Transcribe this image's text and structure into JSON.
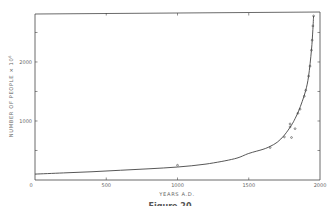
{
  "chart_data": {
    "type": "line",
    "title": "",
    "xlabel": "YEARS A.D.",
    "ylabel": "NUMBER OF PEOPLE × 10⁶",
    "xlim": [
      0,
      2000
    ],
    "ylim": [
      0,
      2830
    ],
    "x_ticks": [
      0,
      500,
      1000,
      1500,
      2000
    ],
    "x_tick_labels": [
      "0",
      "500",
      "1000",
      "1500",
      "2000"
    ],
    "y_ticks": [
      1000,
      2000
    ],
    "y_tick_labels": [
      "1000",
      "2000"
    ],
    "y_minor_ticks": [
      500,
      1500,
      2500
    ],
    "grid": false,
    "legend": null,
    "series": [
      {
        "name": "fitted curve",
        "style": "line",
        "x": [
          0,
          200,
          400,
          600,
          800,
          1000,
          1200,
          1400,
          1500,
          1600,
          1650,
          1700,
          1750,
          1800,
          1825,
          1850,
          1875,
          1900,
          1920,
          1940,
          1950,
          1955
        ],
        "values": [
          100,
          120,
          140,
          165,
          190,
          220,
          270,
          360,
          450,
          520,
          570,
          640,
          760,
          930,
          1040,
          1170,
          1330,
          1520,
          1760,
          2200,
          2550,
          2780
        ]
      },
      {
        "name": "observed data",
        "style": "scatter",
        "x": [
          1000,
          1650,
          1750,
          1790,
          1790,
          1800,
          1825,
          1845,
          1860,
          1890,
          1900,
          1920,
          1930,
          1940,
          1945,
          1950,
          1955
        ],
        "values": [
          250,
          550,
          730,
          950,
          900,
          720,
          870,
          1130,
          1200,
          1420,
          1520,
          1760,
          1930,
          2200,
          2370,
          2610,
          2780
        ]
      }
    ],
    "caption": "Figure 20"
  },
  "labels": {
    "x_axis_title": "YEARS   A.D.",
    "y_axis_title": "NUMBER  OF  PEOPLE  ×  10",
    "y_axis_exponent": "6",
    "x_ticks": [
      "0",
      "500",
      "1000",
      "1500",
      "2000"
    ],
    "y_ticks": [
      "1000",
      "2000"
    ],
    "caption": "Figure 20"
  },
  "colors": {
    "line": "#444444",
    "text": "#666666",
    "background": "#ffffff"
  }
}
